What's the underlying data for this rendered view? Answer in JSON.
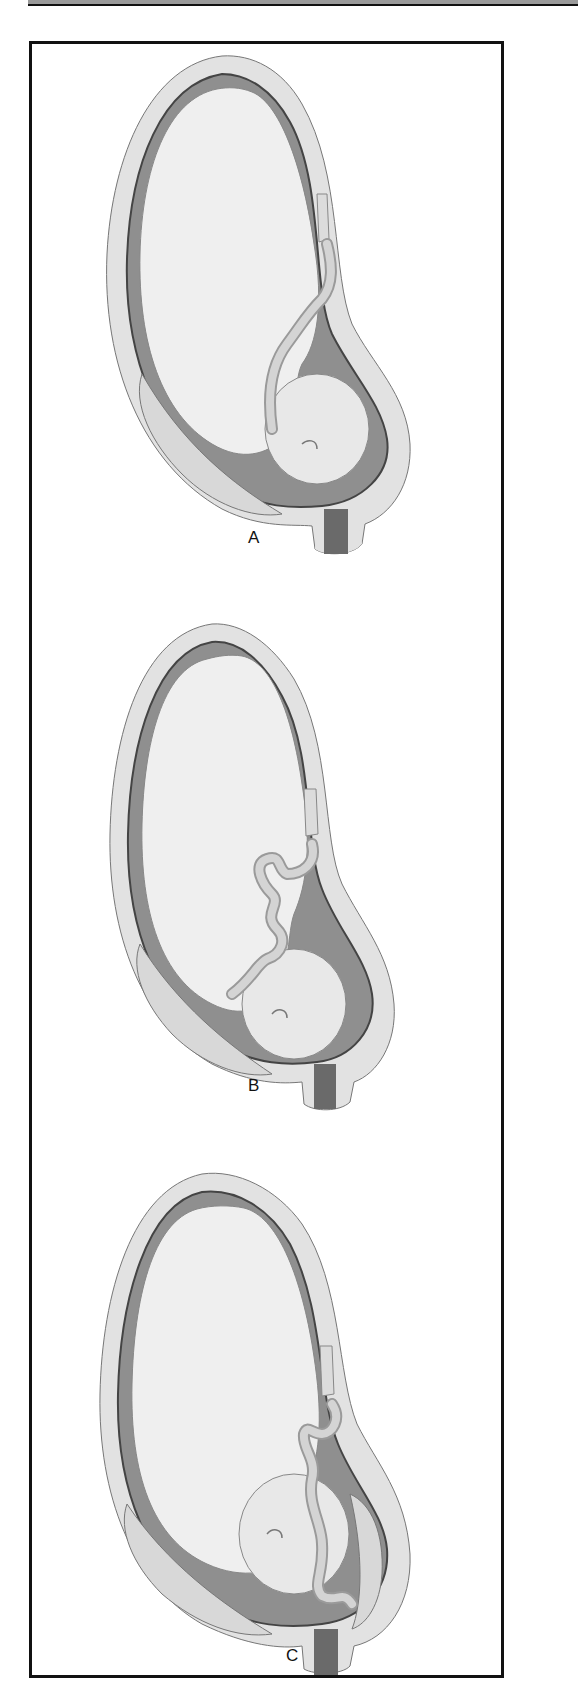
{
  "figure": {
    "panels": [
      {
        "id": "A",
        "label": "A",
        "cord_description": "umbilical cord loops over fetal shoulder toward head"
      },
      {
        "id": "B",
        "label": "B",
        "cord_description": "umbilical cord in multiple coils across fetal chest"
      },
      {
        "id": "C",
        "label": "C",
        "cord_description": "umbilical cord extends down past fetal head toward cervix"
      }
    ]
  },
  "colors": {
    "frame": "#111111",
    "uterine_wall": "#e2e2e2",
    "amniotic_space": "#8f8f8f",
    "fetus": "#efefef",
    "cord": "#c8c8c8",
    "cervix": "#6a6a6a"
  }
}
